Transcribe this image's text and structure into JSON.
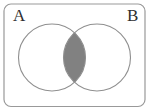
{
  "figure": {
    "type": "venn-diagram",
    "labels": {
      "set_a": "A",
      "set_b": "B"
    },
    "shaded_region": "intersection",
    "colors": {
      "background": "#ffffff",
      "frame_stroke": "#999999",
      "circle_stroke": "#8f8f8f",
      "intersection_fill": "#818181",
      "label_color": "#2f2f2f"
    }
  }
}
